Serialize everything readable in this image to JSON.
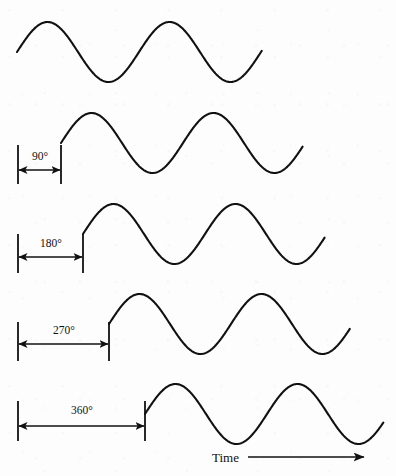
{
  "figure": {
    "background_color": "#fdfdfd",
    "stroke_color": "#111111",
    "width": 396,
    "height": 476
  },
  "axis": {
    "time_label": "Time",
    "time_label_x": 212,
    "time_label_y": 462,
    "arrow_start_x": 248,
    "arrow_end_x": 364,
    "arrow_y": 457
  },
  "chart_data": {
    "type": "line",
    "xlabel": "Time",
    "ylabel": "",
    "grid": false,
    "legend": null,
    "wavelength_px": 122,
    "amplitude_px": 30,
    "series": [
      {
        "name": "0 degrees",
        "phase_deg": 0,
        "start_x": 17,
        "end_x": 262,
        "center_y": 52,
        "amplitude": 30,
        "wavelength": 122,
        "cycles": 2.0,
        "dimension": null
      },
      {
        "name": "90 degrees",
        "phase_deg": 90,
        "start_x": 61,
        "end_x": 303,
        "center_y": 143,
        "amplitude": 30,
        "wavelength": 122,
        "cycles": 2.0,
        "dimension": {
          "label": "90°",
          "from_x": 18,
          "to_x": 61,
          "line_y": 170,
          "label_x": 40,
          "label_y": 160,
          "tick_top_y": 145,
          "tick_bottom_y": 184
        }
      },
      {
        "name": "180 degrees",
        "phase_deg": 180,
        "start_x": 83,
        "end_x": 325,
        "center_y": 234,
        "amplitude": 30,
        "wavelength": 122,
        "cycles": 2.0,
        "dimension": {
          "label": "180°",
          "from_x": 18,
          "to_x": 83,
          "line_y": 257,
          "label_x": 51,
          "label_y": 247,
          "tick_top_y": 234,
          "tick_bottom_y": 273
        }
      },
      {
        "name": "270 degrees",
        "phase_deg": 270,
        "start_x": 109,
        "end_x": 350,
        "center_y": 324,
        "amplitude": 30,
        "wavelength": 122,
        "cycles": 2.0,
        "dimension": {
          "label": "270°",
          "from_x": 18,
          "to_x": 109,
          "line_y": 344,
          "label_x": 64,
          "label_y": 334,
          "tick_top_y": 322,
          "tick_bottom_y": 361
        }
      },
      {
        "name": "360 degrees",
        "phase_deg": 360,
        "start_x": 145,
        "end_x": 384,
        "center_y": 414,
        "amplitude": 30,
        "wavelength": 122,
        "cycles": 2.0,
        "dimension": {
          "label": "360°",
          "from_x": 18,
          "to_x": 145,
          "line_y": 426,
          "label_x": 82,
          "label_y": 414,
          "tick_top_y": 401,
          "tick_bottom_y": 441
        }
      }
    ]
  }
}
